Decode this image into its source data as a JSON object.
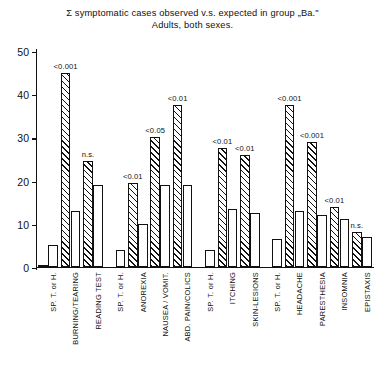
{
  "chart_data": {
    "type": "bar",
    "title": "Σ symptomatic cases observed v.s. expected in group „Ba.\"",
    "subtitle": "Adults, both sexes.",
    "xlabel": "",
    "ylabel": "",
    "ylim": [
      0,
      50
    ],
    "yticks": [
      0,
      10,
      20,
      30,
      40,
      50
    ],
    "ytick_labels": [
      "0",
      "10",
      "20",
      "30",
      "40",
      "50"
    ],
    "grid": false,
    "legend": "none",
    "categories": [
      "SP. T. or H.",
      "BURNING/TEARING",
      "READING TEST",
      "SP. T. or H.",
      "ANOREXIA",
      "NAUSEA / VOMIT.",
      "ABD. PAIN/COLICS",
      "SP. T. or H.",
      "ITCHING",
      "SKIN-LESIONS",
      "SP. T. or H.",
      "HEADACHE",
      "PARESTHESIA",
      "INSOMNIA",
      "EPISTAXIS"
    ],
    "series": [
      {
        "name": "observed",
        "pattern": "hatched",
        "values": [
          0.5,
          45,
          24.5,
          0,
          19.5,
          30,
          37.5,
          0,
          27.5,
          26,
          0,
          37.5,
          29,
          14,
          8
        ]
      },
      {
        "name": "expected",
        "pattern": "white",
        "values": [
          5,
          13,
          19,
          4,
          10,
          19,
          19,
          4,
          13.5,
          12.5,
          6.5,
          13,
          12,
          11,
          7
        ]
      }
    ],
    "significance_labels": [
      {
        "category": "BURNING/TEARING",
        "text": "<0.001"
      },
      {
        "category": "READING TEST",
        "text": "n.s."
      },
      {
        "category": "ANOREXIA",
        "text": "<0.01"
      },
      {
        "category": "NAUSEA / VOMIT.",
        "text": "<0.05"
      },
      {
        "category": "ABD. PAIN/COLICS",
        "text": "<0.01"
      },
      {
        "category": "ITCHING",
        "text": "<0.01"
      },
      {
        "category": "SKIN-LESIONS",
        "text": "<0.01"
      },
      {
        "category": "HEADACHE",
        "text": "<0.001"
      },
      {
        "category": "PARESTHESIA",
        "text": "<0.001"
      },
      {
        "category": "INSOMNIA",
        "text": "<0.01"
      },
      {
        "category": "EPISTAXIS",
        "text": "n.s."
      }
    ]
  }
}
